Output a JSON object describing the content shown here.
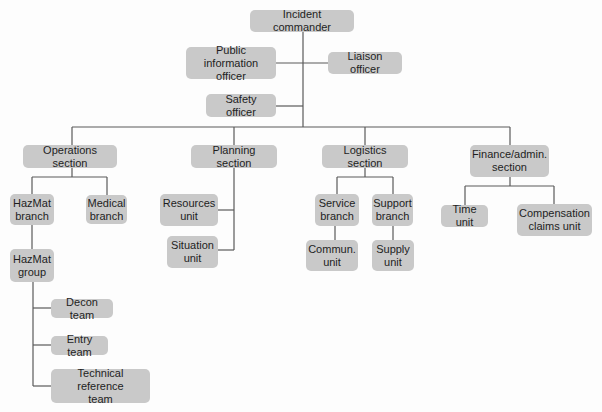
{
  "colors": {
    "node_fill": "#c9c9c9",
    "line": "#5a5a5a",
    "text": "#1e1e1e",
    "background": "#fdfdfd"
  },
  "nodes": {
    "incident_commander": "Incident commander",
    "public_information_officer": "Public information\nofficer",
    "liaison_officer": "Liaison officer",
    "safety_officer": "Safety officer",
    "operations_section": "Operations section",
    "planning_section": "Planning section",
    "logistics_section": "Logistics section",
    "finance_admin_section": "Finance/admin.\nsection",
    "hazmat_branch": "HazMat\nbranch",
    "medical_branch": "Medical\nbranch",
    "hazmat_group": "HazMat\ngroup",
    "decon_team": "Decon team",
    "entry_team": "Entry team",
    "technical_reference_team": "Technical reference\nteam",
    "resources_unit": "Resources\nunit",
    "situation_unit": "Situation\nunit",
    "service_branch": "Service\nbranch",
    "support_branch": "Support\nbranch",
    "commun_unit": "Commun.\nunit",
    "supply_unit": "Supply\nunit",
    "time_unit": "Time unit",
    "compensation_claims_unit": "Compensation\nclaims unit"
  },
  "edges": [
    [
      "incident_commander",
      "public_information_officer"
    ],
    [
      "incident_commander",
      "liaison_officer"
    ],
    [
      "incident_commander",
      "safety_officer"
    ],
    [
      "incident_commander",
      "operations_section"
    ],
    [
      "incident_commander",
      "planning_section"
    ],
    [
      "incident_commander",
      "logistics_section"
    ],
    [
      "incident_commander",
      "finance_admin_section"
    ],
    [
      "operations_section",
      "hazmat_branch"
    ],
    [
      "operations_section",
      "medical_branch"
    ],
    [
      "hazmat_branch",
      "hazmat_group"
    ],
    [
      "hazmat_group",
      "decon_team"
    ],
    [
      "hazmat_group",
      "entry_team"
    ],
    [
      "hazmat_group",
      "technical_reference_team"
    ],
    [
      "planning_section",
      "resources_unit"
    ],
    [
      "planning_section",
      "situation_unit"
    ],
    [
      "logistics_section",
      "service_branch"
    ],
    [
      "logistics_section",
      "support_branch"
    ],
    [
      "service_branch",
      "commun_unit"
    ],
    [
      "support_branch",
      "supply_unit"
    ],
    [
      "finance_admin_section",
      "time_unit"
    ],
    [
      "finance_admin_section",
      "compensation_claims_unit"
    ]
  ]
}
